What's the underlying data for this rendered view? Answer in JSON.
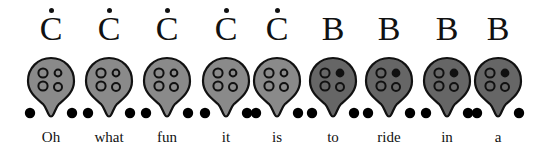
{
  "colors": {
    "c_body": "#8a8a8a",
    "b_body": "#666666",
    "outline": "#111111",
    "hole_open_fill_c": "#8a8a8a",
    "hole_open_fill_b": "#666666",
    "hole_closed": "#111111",
    "foot": "#000000"
  },
  "notes": [
    {
      "note": "C",
      "high_dot": true,
      "word": "Oh",
      "x": 51,
      "body": "c",
      "holes": {
        "tl": "open",
        "tr": "open",
        "bl": "open",
        "br": "open"
      }
    },
    {
      "note": "C",
      "high_dot": true,
      "word": "what",
      "x": 109,
      "body": "c",
      "holes": {
        "tl": "open",
        "tr": "open",
        "bl": "open",
        "br": "open"
      }
    },
    {
      "note": "C",
      "high_dot": true,
      "word": "fun",
      "x": 167,
      "body": "c",
      "holes": {
        "tl": "open",
        "tr": "open",
        "bl": "open",
        "br": "open"
      }
    },
    {
      "note": "C",
      "high_dot": true,
      "word": "it",
      "x": 226,
      "body": "c",
      "holes": {
        "tl": "open",
        "tr": "open",
        "bl": "open",
        "br": "open"
      }
    },
    {
      "note": "C",
      "high_dot": true,
      "word": "is",
      "x": 277,
      "body": "c",
      "holes": {
        "tl": "open",
        "tr": "open",
        "bl": "open",
        "br": "open"
      }
    },
    {
      "note": "B",
      "high_dot": false,
      "word": "to",
      "x": 333,
      "body": "b",
      "holes": {
        "tl": "open",
        "tr": "closed",
        "bl": "open",
        "br": "open"
      }
    },
    {
      "note": "B",
      "high_dot": false,
      "word": "ride",
      "x": 389,
      "body": "b",
      "holes": {
        "tl": "open",
        "tr": "closed",
        "bl": "open",
        "br": "open"
      }
    },
    {
      "note": "B",
      "high_dot": false,
      "word": "in",
      "x": 447,
      "body": "b",
      "holes": {
        "tl": "open",
        "tr": "closed",
        "bl": "open",
        "br": "open"
      }
    },
    {
      "note": "B",
      "high_dot": false,
      "word": "a",
      "x": 498,
      "body": "b",
      "holes": {
        "tl": "open",
        "tr": "closed",
        "bl": "open",
        "br": "open"
      }
    }
  ]
}
